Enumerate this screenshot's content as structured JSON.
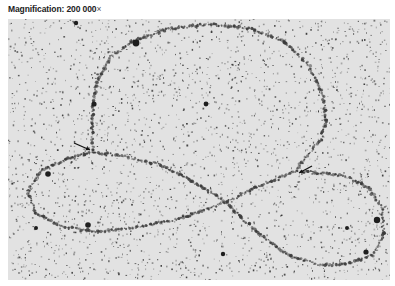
{
  "caption": {
    "label": "Magnification: 200 000",
    "times_symbol": "×"
  },
  "micrograph": {
    "description": "Electron micrograph of beaded chromatin/DNA strand forming a large upper loop and a lower figure-eight",
    "background_color": "#e2e2e2",
    "speckle_color": "#2a2a2a",
    "strand_color": "#3a3a3a",
    "arrow_color": "#111111",
    "strand_path": [
      [
        85,
        133
      ],
      [
        84,
        110
      ],
      [
        85,
        85
      ],
      [
        90,
        60
      ],
      [
        103,
        38
      ],
      [
        125,
        22
      ],
      [
        160,
        10
      ],
      [
        200,
        5
      ],
      [
        240,
        9
      ],
      [
        275,
        22
      ],
      [
        300,
        45
      ],
      [
        315,
        75
      ],
      [
        318,
        100
      ],
      [
        313,
        120
      ],
      [
        300,
        135
      ],
      [
        287,
        152
      ],
      [
        270,
        160
      ],
      [
        245,
        170
      ],
      [
        218,
        183
      ],
      [
        200,
        190
      ],
      [
        170,
        200
      ],
      [
        130,
        208
      ],
      [
        90,
        213
      ],
      [
        55,
        208
      ],
      [
        28,
        195
      ],
      [
        20,
        172
      ],
      [
        35,
        150
      ],
      [
        60,
        140
      ],
      [
        85,
        133
      ],
      [
        115,
        137
      ],
      [
        150,
        145
      ],
      [
        180,
        160
      ],
      [
        205,
        175
      ],
      [
        218,
        183
      ],
      [
        235,
        200
      ],
      [
        255,
        218
      ],
      [
        280,
        236
      ],
      [
        310,
        246
      ],
      [
        340,
        245
      ],
      [
        365,
        236
      ],
      [
        376,
        215
      ],
      [
        374,
        190
      ],
      [
        360,
        168
      ],
      [
        335,
        157
      ],
      [
        305,
        153
      ],
      [
        287,
        152
      ]
    ],
    "blobs": [
      {
        "x": 128,
        "y": 24,
        "r": 3.4
      },
      {
        "x": 198,
        "y": 85,
        "r": 2.4
      },
      {
        "x": 68,
        "y": 4,
        "r": 2.2
      },
      {
        "x": 369,
        "y": 201,
        "r": 3.2
      },
      {
        "x": 339,
        "y": 209,
        "r": 2.0
      },
      {
        "x": 358,
        "y": 233,
        "r": 2.6
      },
      {
        "x": 86,
        "y": 85,
        "r": 2.6
      },
      {
        "x": 40,
        "y": 155,
        "r": 2.8
      },
      {
        "x": 80,
        "y": 206,
        "r": 2.8
      },
      {
        "x": 215,
        "y": 235,
        "r": 2.2
      },
      {
        "x": 28,
        "y": 209,
        "r": 2.0
      }
    ],
    "arrows": [
      {
        "from": [
          66,
          124
        ],
        "to": [
          82,
          131
        ]
      },
      {
        "from": [
          304,
          147
        ],
        "to": [
          291,
          154
        ]
      }
    ]
  }
}
